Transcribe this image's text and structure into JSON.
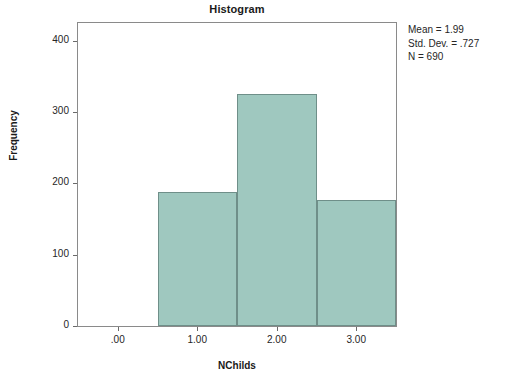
{
  "chart_data": {
    "type": "bar",
    "title": "Histogram",
    "xlabel": "NChilds",
    "ylabel": "Frequency",
    "categories": [
      "1.00",
      "2.00",
      "3.00"
    ],
    "values": [
      188,
      325,
      177
    ],
    "bin_centers": [
      1,
      2,
      3
    ],
    "bin_width": 1,
    "xlim": [
      -0.5,
      3.5
    ],
    "ylim": [
      0,
      425
    ],
    "x_ticks": [
      ".00",
      "1.00",
      "2.00",
      "3.00"
    ],
    "x_tick_values": [
      0,
      1,
      2,
      3
    ],
    "y_ticks": [
      "0",
      "100",
      "200",
      "300",
      "400"
    ],
    "y_tick_values": [
      0,
      100,
      200,
      300,
      400
    ],
    "grid": false,
    "legend": false,
    "bar_fill_color": "#9fc8bf",
    "bar_border_color": "#6f8f89",
    "frame_color": "#8a8a8a",
    "annotations": [
      "Mean = 1.99",
      "Std. Dev. = .727",
      "N = 690"
    ]
  },
  "stats": {
    "mean": "Mean = 1.99",
    "std_dev": "Std. Dev. = .727",
    "n": "N = 690"
  }
}
